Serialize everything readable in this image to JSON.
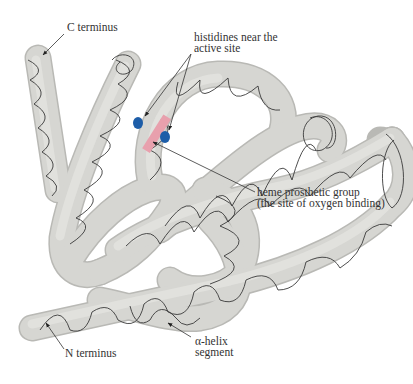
{
  "figure": {
    "labels": {
      "c_terminus": "C terminus",
      "histidines": [
        "histidines near the",
        "active site"
      ],
      "heme": [
        "heme prosthetic group",
        "(the site of oxygen binding)"
      ],
      "n_terminus": "N terminus",
      "alpha_helix": [
        "α-helix",
        "segment"
      ]
    },
    "colors": {
      "tube_fill": "#d4d4d0",
      "tube_edge": "#b9b9b5",
      "helix_line": "#3a3a3a",
      "heme": "#e8a0ad",
      "histidine": "#1d5da8",
      "text": "#333333",
      "leader": "#333333"
    }
  }
}
